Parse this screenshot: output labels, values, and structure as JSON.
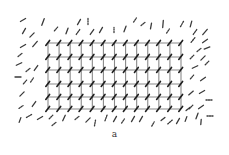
{
  "figure": {
    "caption": "a",
    "colors": {
      "lattice_line": "#8a8a8a",
      "node_stroke": "#1e1e1e",
      "disordered_stroke": "#3a3a3a",
      "background": "#ffffff"
    },
    "lattice": {
      "columns": 13,
      "rows": 6,
      "x_start": 48,
      "x_end": 181,
      "y_positions": [
        43,
        57,
        70,
        84,
        97,
        109
      ]
    },
    "disordered_molecules": [
      {
        "x": 23,
        "y": 20,
        "a": -30,
        "l": 6,
        "d": false
      },
      {
        "x": 43,
        "y": 22,
        "a": -70,
        "l": 7,
        "d": false
      },
      {
        "x": 24,
        "y": 31,
        "a": -60,
        "l": 6,
        "d": false
      },
      {
        "x": 32,
        "y": 35,
        "a": -45,
        "l": 6,
        "d": false
      },
      {
        "x": 56,
        "y": 29,
        "a": -50,
        "l": 5,
        "d": true
      },
      {
        "x": 67,
        "y": 31,
        "a": -70,
        "l": 6,
        "d": false
      },
      {
        "x": 79,
        "y": 22,
        "a": -60,
        "l": 6,
        "d": false
      },
      {
        "x": 88,
        "y": 21,
        "a": -90,
        "l": 7,
        "d": true
      },
      {
        "x": 78,
        "y": 32,
        "a": -55,
        "l": 6,
        "d": true
      },
      {
        "x": 92,
        "y": 32,
        "a": -55,
        "l": 6,
        "d": false
      },
      {
        "x": 101,
        "y": 30,
        "a": -60,
        "l": 6,
        "d": false
      },
      {
        "x": 114,
        "y": 30,
        "a": -90,
        "l": 5,
        "d": true
      },
      {
        "x": 125,
        "y": 29,
        "a": -70,
        "l": 6,
        "d": false
      },
      {
        "x": 135,
        "y": 20,
        "a": -55,
        "l": 5,
        "d": true
      },
      {
        "x": 143,
        "y": 24,
        "a": -40,
        "l": 5,
        "d": true
      },
      {
        "x": 151,
        "y": 26,
        "a": -80,
        "l": 6,
        "d": false
      },
      {
        "x": 163,
        "y": 24,
        "a": -85,
        "l": 7,
        "d": false
      },
      {
        "x": 168,
        "y": 31,
        "a": -55,
        "l": 5,
        "d": true
      },
      {
        "x": 182,
        "y": 24,
        "a": -60,
        "l": 6,
        "d": true
      },
      {
        "x": 191,
        "y": 24,
        "a": -75,
        "l": 6,
        "d": false
      },
      {
        "x": 195,
        "y": 32,
        "a": -55,
        "l": 6,
        "d": true
      },
      {
        "x": 205,
        "y": 32,
        "a": -50,
        "l": 7,
        "d": false
      },
      {
        "x": 23,
        "y": 46,
        "a": -30,
        "l": 6,
        "d": false
      },
      {
        "x": 35,
        "y": 44,
        "a": -50,
        "l": 7,
        "d": false
      },
      {
        "x": 20,
        "y": 55,
        "a": -40,
        "l": 5,
        "d": true
      },
      {
        "x": 19,
        "y": 64,
        "a": -25,
        "l": 6,
        "d": false
      },
      {
        "x": 28,
        "y": 70,
        "a": -40,
        "l": 5,
        "d": true
      },
      {
        "x": 36,
        "y": 68,
        "a": -55,
        "l": 6,
        "d": false
      },
      {
        "x": 18,
        "y": 77,
        "a": 0,
        "l": 6,
        "d": false
      },
      {
        "x": 25,
        "y": 82,
        "a": -50,
        "l": 5,
        "d": true
      },
      {
        "x": 32,
        "y": 80,
        "a": -55,
        "l": 5,
        "d": true
      },
      {
        "x": 22,
        "y": 94,
        "a": -45,
        "l": 6,
        "d": false
      },
      {
        "x": 21,
        "y": 107,
        "a": -35,
        "l": 5,
        "d": true
      },
      {
        "x": 34,
        "y": 104,
        "a": -55,
        "l": 6,
        "d": false
      },
      {
        "x": 193,
        "y": 40,
        "a": -50,
        "l": 6,
        "d": true
      },
      {
        "x": 205,
        "y": 41,
        "a": -35,
        "l": 6,
        "d": false
      },
      {
        "x": 199,
        "y": 50,
        "a": -40,
        "l": 5,
        "d": true
      },
      {
        "x": 207,
        "y": 48,
        "a": -20,
        "l": 6,
        "d": false
      },
      {
        "x": 192,
        "y": 57,
        "a": -45,
        "l": 5,
        "d": true
      },
      {
        "x": 203,
        "y": 58,
        "a": -45,
        "l": 6,
        "d": false
      },
      {
        "x": 195,
        "y": 67,
        "a": -25,
        "l": 6,
        "d": false
      },
      {
        "x": 207,
        "y": 63,
        "a": -45,
        "l": 5,
        "d": true
      },
      {
        "x": 192,
        "y": 77,
        "a": -50,
        "l": 5,
        "d": true
      },
      {
        "x": 203,
        "y": 79,
        "a": -35,
        "l": 6,
        "d": false
      },
      {
        "x": 191,
        "y": 93,
        "a": -40,
        "l": 6,
        "d": false
      },
      {
        "x": 202,
        "y": 92,
        "a": -30,
        "l": 6,
        "d": false
      },
      {
        "x": 209,
        "y": 100,
        "a": 0,
        "l": 6,
        "d": true
      },
      {
        "x": 191,
        "y": 107,
        "a": -45,
        "l": 5,
        "d": true
      },
      {
        "x": 201,
        "y": 107,
        "a": -35,
        "l": 6,
        "d": false
      },
      {
        "x": 197,
        "y": 116,
        "a": -70,
        "l": 6,
        "d": false
      },
      {
        "x": 210,
        "y": 116,
        "a": 0,
        "l": 6,
        "d": true
      },
      {
        "x": 201,
        "y": 122,
        "a": -85,
        "l": 5,
        "d": false
      },
      {
        "x": 20,
        "y": 120,
        "a": -70,
        "l": 5,
        "d": false
      },
      {
        "x": 29,
        "y": 116,
        "a": -30,
        "l": 6,
        "d": true
      },
      {
        "x": 40,
        "y": 118,
        "a": -30,
        "l": 6,
        "d": false
      },
      {
        "x": 51,
        "y": 117,
        "a": -45,
        "l": 5,
        "d": true
      },
      {
        "x": 54,
        "y": 124,
        "a": -40,
        "l": 5,
        "d": true
      },
      {
        "x": 64,
        "y": 118,
        "a": -65,
        "l": 6,
        "d": false
      },
      {
        "x": 77,
        "y": 118,
        "a": -40,
        "l": 5,
        "d": true
      },
      {
        "x": 88,
        "y": 120,
        "a": -45,
        "l": 6,
        "d": false
      },
      {
        "x": 95,
        "y": 123,
        "a": -80,
        "l": 6,
        "d": true
      },
      {
        "x": 106,
        "y": 118,
        "a": -70,
        "l": 6,
        "d": true
      },
      {
        "x": 115,
        "y": 119,
        "a": -60,
        "l": 6,
        "d": false
      },
      {
        "x": 123,
        "y": 121,
        "a": -55,
        "l": 5,
        "d": true
      },
      {
        "x": 133,
        "y": 119,
        "a": -60,
        "l": 6,
        "d": false
      },
      {
        "x": 141,
        "y": 119,
        "a": -60,
        "l": 6,
        "d": false
      },
      {
        "x": 153,
        "y": 124,
        "a": -60,
        "l": 5,
        "d": true
      },
      {
        "x": 163,
        "y": 119,
        "a": -40,
        "l": 5,
        "d": false
      },
      {
        "x": 170,
        "y": 122,
        "a": -40,
        "l": 6,
        "d": true
      },
      {
        "x": 178,
        "y": 121,
        "a": -60,
        "l": 6,
        "d": false
      },
      {
        "x": 186,
        "y": 119,
        "a": -70,
        "l": 5,
        "d": false
      },
      {
        "x": 188,
        "y": 109,
        "a": -40,
        "l": 5,
        "d": false
      }
    ]
  }
}
